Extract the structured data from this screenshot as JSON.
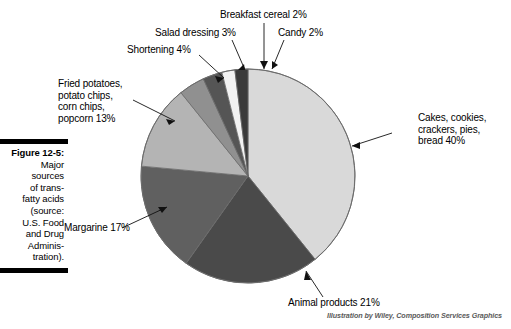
{
  "figure": {
    "number": "Figure 12-5:",
    "caption_lines": [
      "Major",
      "sources",
      "of trans-",
      "fatty acids",
      "(source:",
      "U.S. Food",
      "and Drug",
      "Adminis-",
      "tration)."
    ]
  },
  "credit": "Illustration by Wiley, Composition Services Graphics",
  "chart_data": {
    "type": "pie",
    "source": "U.S. Food and Drug Administration",
    "units": "percent",
    "start_angle_deg": 0,
    "direction": "clockwise",
    "categories": [
      "Cakes, cookies, crackers, pies, bread",
      "Animal products",
      "Margarine",
      "Fried potatoes, potato chips, corn chips, popcorn",
      "Shortening",
      "Salad dressing",
      "Breakfast cereal",
      "Candy"
    ],
    "values": [
      40,
      21,
      17,
      13,
      4,
      3,
      2,
      2
    ],
    "colors": [
      "#d9d9d9",
      "#4a4a4a",
      "#606060",
      "#b4b4b4",
      "#909090",
      "#555555",
      "#f2f2f2",
      "#3a3a3a"
    ],
    "slices": [
      {
        "label": "Cakes, cookies, crackers, pies, bread 40%",
        "name": "Cakes, cookies, crackers, pies, bread",
        "value": 40,
        "color": "#d9d9d9"
      },
      {
        "label": "Animal products 21%",
        "name": "Animal products",
        "value": 21,
        "color": "#4a4a4a"
      },
      {
        "label": "Margarine 17%",
        "name": "Margarine",
        "value": 17,
        "color": "#606060"
      },
      {
        "label": "Fried potatoes, potato chips, corn chips, popcorn 13%",
        "name": "Fried potatoes, potato chips, corn chips, popcorn",
        "value": 13,
        "color": "#b4b4b4"
      },
      {
        "label": "Shortening 4%",
        "name": "Shortening",
        "value": 4,
        "color": "#909090"
      },
      {
        "label": "Salad dressing 3%",
        "name": "Salad dressing",
        "value": 3,
        "color": "#555555"
      },
      {
        "label": "Breakfast cereal 2%",
        "name": "Breakfast cereal",
        "value": 2,
        "color": "#f2f2f2"
      },
      {
        "label": "Candy 2%",
        "name": "Candy",
        "value": 2,
        "color": "#3a3a3a"
      }
    ],
    "legend": "none",
    "grid": false
  },
  "labels": {
    "cakes": [
      "Cakes, cookies,",
      "crackers, pies,",
      "bread 40%"
    ],
    "animal": [
      "Animal products 21%"
    ],
    "margarine": [
      "Margarine 17%"
    ],
    "fried": [
      "Fried potatoes,",
      "potato chips,",
      "corn chips,",
      "popcorn 13%"
    ],
    "shortening": [
      "Shortening 4%"
    ],
    "salad": [
      "Salad dressing 3%"
    ],
    "cereal": [
      "Breakfast cereal 2%"
    ],
    "candy": [
      "Candy 2%"
    ]
  }
}
